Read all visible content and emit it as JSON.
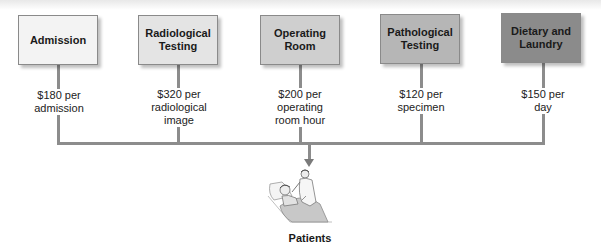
{
  "diagram": {
    "type": "cost-allocation-flow",
    "departments": [
      {
        "name": "Admission",
        "cost": "$180 per admission",
        "cost_lines": [
          "$180 per",
          "admission"
        ],
        "fill": "#f3f3f3"
      },
      {
        "name": "Radiological Testing",
        "name_lines": [
          "Radiological",
          "Testing"
        ],
        "cost": "$320 per radiological image",
        "cost_lines": [
          "$320 per",
          "radiological",
          "image"
        ],
        "fill": "#e4e4e4"
      },
      {
        "name": "Operating Room",
        "name_lines": [
          "Operating",
          "Room"
        ],
        "cost": "$200 per operating room hour",
        "cost_lines": [
          "$200 per",
          "operating",
          "room hour"
        ],
        "fill": "#cfcfcf"
      },
      {
        "name": "Pathological Testing",
        "name_lines": [
          "Pathological",
          "Testing"
        ],
        "cost": "$120 per specimen",
        "cost_lines": [
          "$120 per",
          "specimen"
        ],
        "fill": "#b6b6b6"
      },
      {
        "name": "Dietary and Laundry",
        "name_lines": [
          "Dietary and",
          "Laundry"
        ],
        "cost": "$150 per day",
        "cost_lines": [
          "$150 per",
          "day"
        ],
        "fill": "#8b8b8b"
      }
    ],
    "target": {
      "label": "Patients",
      "icon": "patient-in-bed-with-doctor-illustration"
    },
    "connector_color": "#8c8c8c"
  }
}
